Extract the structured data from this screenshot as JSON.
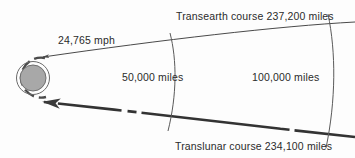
{
  "diagram": {
    "title_semantic": "apollo-free-return-trajectory-around-the-moon",
    "background_color": "#fdfdfd",
    "line_color": "#4a4a4a",
    "heavy_line_color": "#333333",
    "text_color": "#2b2b2b",
    "moon_fill_color": "#a8a8a8",
    "moon_outline_color": "#5a5a5a",
    "labels": {
      "transearth_course": "Transearth course 237,200 miles",
      "translunar_course": "Translunar course 234,100 miles",
      "speed": "24,765 mph",
      "distance_near": "50,000 miles",
      "distance_far": "100,000 miles"
    },
    "body": {
      "name": "moon",
      "center_x": 33,
      "center_y": 78,
      "radius": 13
    },
    "markers": [
      {
        "name": "arc-50000-miles",
        "x": 172,
        "label": "50,000 miles"
      },
      {
        "name": "arc-100000-miles",
        "x": 330,
        "label": "100,000 miles"
      }
    ],
    "paths": {
      "transearth_direction": "leftward-arrow-toward-moon",
      "translunar_direction": "rightward-arrow-away-from-moon",
      "translunar_style": "dashed-heavy",
      "transearth_style": "solid-thin"
    }
  }
}
